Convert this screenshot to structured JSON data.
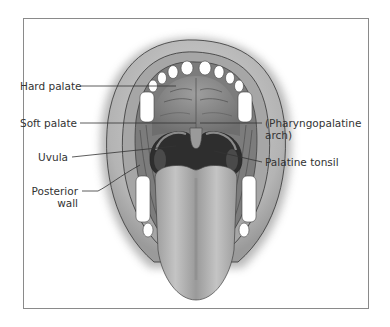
{
  "figure": {
    "labels": {
      "hard_palate": "Hard palate",
      "soft_palate": "Soft palate",
      "uvula": "Uvula",
      "posterior_wall_line1": "Posterior",
      "posterior_wall_line2": "wall",
      "pharyngopalatine_line1": "(Pharyngopalatine",
      "pharyngopalatine_line2": "arch)",
      "palatine_tonsil": "Palatine tonsil"
    },
    "colors": {
      "frame": "#8a8a8a",
      "lip": "#bdbdbd",
      "palate": "#8f8f8f",
      "throat": "#2e2e2e",
      "tongue": "#a8a8a8",
      "teeth": "#ffffff",
      "leader_line": "#333333",
      "label_text": "#333333"
    }
  }
}
